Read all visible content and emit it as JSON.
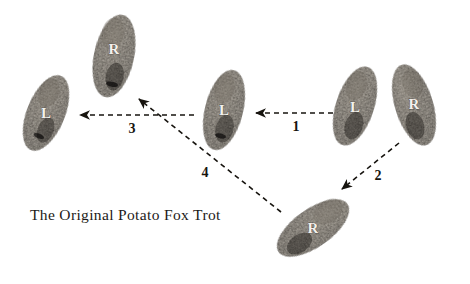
{
  "figure": {
    "title": "The Original Potato Fox Trot",
    "caption": "The Original Potato Fox Trot",
    "background_color": "#ffffff",
    "ink_color": "#17140f",
    "potato_dark_color": "#2b2724",
    "potato_light_color": "#6f6a61",
    "letter_color": "#f3f1ec"
  },
  "potatoes": [
    {
      "id": "potato-left-l",
      "label": "L",
      "position": "far-left",
      "cx": 46,
      "cy": 113,
      "rx": 19,
      "ry": 40,
      "rotation": 22
    },
    {
      "id": "potato-top-r",
      "label": "R",
      "position": "upper-middle-left",
      "cx": 114,
      "cy": 56,
      "rx": 20,
      "ry": 42,
      "rotation": 12
    },
    {
      "id": "potato-middle-l",
      "label": "L",
      "position": "center",
      "cx": 224,
      "cy": 110,
      "rx": 19,
      "ry": 41,
      "rotation": 14
    },
    {
      "id": "potato-right-l",
      "label": "L",
      "position": "far-right-inner",
      "cx": 355,
      "cy": 106,
      "rx": 19,
      "ry": 41,
      "rotation": 18
    },
    {
      "id": "potato-right-r",
      "label": "R",
      "position": "far-right-outer",
      "cx": 414,
      "cy": 105,
      "rx": 19,
      "ry": 42,
      "rotation": -17
    },
    {
      "id": "potato-bottom-r",
      "label": "R",
      "position": "bottom-right",
      "cx": 313,
      "cy": 228,
      "rx": 19,
      "ry": 42,
      "rotation": 55
    }
  ],
  "arrows": [
    {
      "id": "arrow-1",
      "number": "1",
      "from": "potato-right-l",
      "to": "potato-middle-l",
      "x1": 333,
      "y1": 113,
      "x2": 256,
      "y2": 113,
      "label_x": 296,
      "label_y": 131,
      "direction": "left"
    },
    {
      "id": "arrow-2",
      "number": "2",
      "from": "potato-right-r",
      "to": "potato-bottom-r",
      "x1": 399,
      "y1": 143,
      "x2": 342,
      "y2": 189,
      "label_x": 378,
      "label_y": 180,
      "direction": "down-left"
    },
    {
      "id": "arrow-3",
      "number": "3",
      "from": "potato-middle-l",
      "to": "potato-left-l",
      "x1": 194,
      "y1": 115,
      "x2": 80,
      "y2": 115,
      "label_x": 132,
      "label_y": 133,
      "direction": "left"
    },
    {
      "id": "arrow-4",
      "number": "4",
      "from": "potato-bottom-r",
      "to": "potato-top-r",
      "x1": 281,
      "y1": 212,
      "x2": 139,
      "y2": 99,
      "label_x": 205,
      "label_y": 177,
      "direction": "up-left"
    }
  ]
}
